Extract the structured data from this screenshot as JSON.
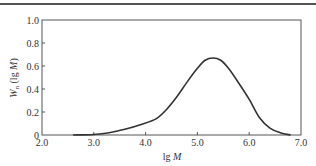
{
  "chart_data": {
    "type": "line",
    "title": "",
    "xlabel": "lg M",
    "ylabel": "W_n (lg M)",
    "xlim": [
      2.0,
      7.0
    ],
    "ylim": [
      0,
      1.0
    ],
    "grid": false,
    "legend": null,
    "x_ticks": [
      "2.0",
      "3.0",
      "4.0",
      "5.0",
      "6.0",
      "7.0"
    ],
    "y_ticks": [
      "0",
      "0.2",
      "0.4",
      "0.6",
      "0.8",
      "1.0"
    ],
    "series": [
      {
        "name": "molecular weight distribution",
        "x": [
          2.6,
          3.0,
          3.3,
          3.6,
          3.9,
          4.2,
          4.4,
          4.6,
          4.8,
          5.0,
          5.15,
          5.3,
          5.45,
          5.6,
          5.8,
          6.0,
          6.2,
          6.4,
          6.6,
          6.8
        ],
        "y": [
          0.0,
          0.005,
          0.02,
          0.05,
          0.09,
          0.14,
          0.22,
          0.33,
          0.46,
          0.58,
          0.65,
          0.67,
          0.65,
          0.58,
          0.45,
          0.31,
          0.15,
          0.06,
          0.02,
          0.0
        ]
      }
    ],
    "peak": {
      "x": 5.3,
      "y": 0.67
    }
  },
  "labels": {
    "xlabel_main": "lg ",
    "xlabel_var": "M",
    "ylabel_main": "W",
    "ylabel_sub": "n",
    "ylabel_rest": " (lg ",
    "ylabel_var": "M",
    "ylabel_close": ")"
  }
}
